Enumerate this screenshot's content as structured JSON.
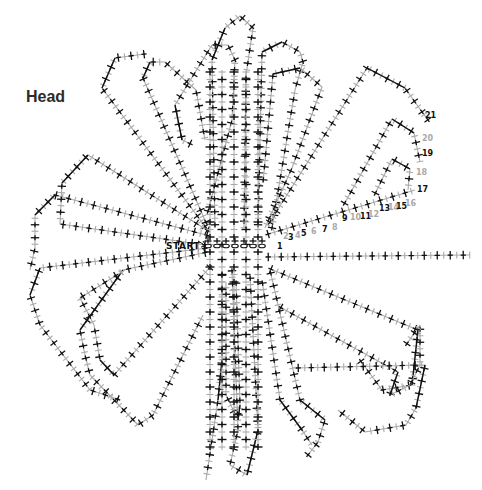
{
  "title": "Head",
  "start_label": "START",
  "colors": {
    "black": "#111111",
    "grey": "#a9a9a9",
    "background": "#ffffff"
  },
  "round_numbers": [
    {
      "n": "1",
      "x": 277,
      "y": 249,
      "color": "black"
    },
    {
      "n": "2",
      "x": 283,
      "y": 239,
      "color": "grey"
    },
    {
      "n": "3",
      "x": 288,
      "y": 240,
      "color": "black"
    },
    {
      "n": "4",
      "x": 295,
      "y": 238,
      "color": "grey"
    },
    {
      "n": "5",
      "x": 301,
      "y": 236,
      "color": "black"
    },
    {
      "n": "6",
      "x": 311,
      "y": 234,
      "color": "grey"
    },
    {
      "n": "7",
      "x": 322,
      "y": 232,
      "color": "black"
    },
    {
      "n": "8",
      "x": 332,
      "y": 230,
      "color": "grey"
    },
    {
      "n": "9",
      "x": 342,
      "y": 221,
      "color": "black"
    },
    {
      "n": "10",
      "x": 350,
      "y": 220,
      "color": "grey"
    },
    {
      "n": "11",
      "x": 360,
      "y": 219,
      "color": "black"
    },
    {
      "n": "12",
      "x": 368,
      "y": 217,
      "color": "grey"
    },
    {
      "n": "13",
      "x": 379,
      "y": 211,
      "color": "black"
    },
    {
      "n": "14",
      "x": 388,
      "y": 210,
      "color": "grey"
    },
    {
      "n": "15",
      "x": 396,
      "y": 209,
      "color": "black"
    },
    {
      "n": "16",
      "x": 405,
      "y": 206,
      "color": "grey"
    },
    {
      "n": "17",
      "x": 417,
      "y": 192,
      "color": "black"
    },
    {
      "n": "18",
      "x": 416,
      "y": 175,
      "color": "grey"
    },
    {
      "n": "19",
      "x": 422,
      "y": 156,
      "color": "black"
    },
    {
      "n": "20",
      "x": 422,
      "y": 141,
      "color": "grey"
    },
    {
      "n": "21",
      "x": 425,
      "y": 118,
      "color": "black"
    }
  ],
  "petals": [
    {
      "name": "top-left-outer",
      "points": [
        [
          207,
          229
        ],
        [
          102,
          88
        ],
        [
          115,
          58
        ],
        [
          145,
          54
        ]
      ],
      "open": true
    },
    {
      "name": "top-left-2",
      "points": [
        [
          207,
          225
        ],
        [
          143,
          78
        ],
        [
          150,
          62
        ],
        [
          165,
          62
        ],
        [
          196,
          90
        ],
        [
          205,
          140
        ]
      ]
    },
    {
      "name": "top-left-3",
      "points": [
        [
          193,
          145
        ],
        [
          182,
          140
        ],
        [
          175,
          105
        ],
        [
          212,
          45
        ],
        [
          228,
          45
        ],
        [
          235,
          60
        ],
        [
          232,
          120
        ],
        [
          207,
          215
        ]
      ]
    },
    {
      "name": "top-mid-1",
      "points": [
        [
          215,
          228
        ],
        [
          212,
          60
        ],
        [
          225,
          28
        ],
        [
          240,
          16
        ],
        [
          253,
          28
        ],
        [
          246,
          75
        ],
        [
          244,
          228
        ]
      ]
    },
    {
      "name": "top-mid-2",
      "points": [
        [
          258,
          228
        ],
        [
          262,
          52
        ],
        [
          282,
          42
        ],
        [
          300,
          52
        ],
        [
          303,
          62
        ],
        [
          295,
          90
        ],
        [
          272,
          228
        ]
      ]
    },
    {
      "name": "top-right-1",
      "points": [
        [
          263,
          183
        ],
        [
          273,
          74
        ],
        [
          300,
          68
        ],
        [
          322,
          87
        ],
        [
          292,
          168
        ],
        [
          265,
          228
        ]
      ]
    },
    {
      "name": "top-right-2",
      "points": [
        [
          268,
          225
        ],
        [
          367,
          68
        ],
        [
          405,
          88
        ],
        [
          422,
          112
        ],
        [
          428,
          120
        ]
      ],
      "open": true
    },
    {
      "name": "right-small-1",
      "points": [
        [
          343,
          206
        ],
        [
          392,
          119
        ],
        [
          414,
          133
        ],
        [
          420,
          162
        ]
      ],
      "open": true
    },
    {
      "name": "right-small-2",
      "points": [
        [
          374,
          196
        ],
        [
          392,
          159
        ],
        [
          410,
          169
        ],
        [
          408,
          190
        ]
      ],
      "open": true
    },
    {
      "name": "round-1-row",
      "points": [
        [
          265,
          235
        ],
        [
          415,
          190
        ]
      ],
      "open": true
    },
    {
      "name": "left-outer",
      "points": [
        [
          210,
          236
        ],
        [
          55,
          195
        ],
        [
          35,
          215
        ],
        [
          35,
          248
        ],
        [
          30,
          270
        ]
      ],
      "open": true
    },
    {
      "name": "left-2",
      "points": [
        [
          210,
          232
        ],
        [
          88,
          155
        ],
        [
          62,
          183
        ],
        [
          60,
          224
        ],
        [
          205,
          245
        ]
      ]
    },
    {
      "name": "left-bottom-1",
      "points": [
        [
          208,
          248
        ],
        [
          40,
          268
        ],
        [
          30,
          295
        ],
        [
          40,
          325
        ],
        [
          90,
          390
        ],
        [
          120,
          400
        ]
      ],
      "open": true
    },
    {
      "name": "left-bottom-2",
      "points": [
        [
          208,
          252
        ],
        [
          123,
          270
        ],
        [
          80,
          330
        ],
        [
          85,
          355
        ],
        [
          90,
          375
        ],
        [
          138,
          425
        ],
        [
          153,
          415
        ],
        [
          203,
          315
        ]
      ]
    },
    {
      "name": "left-bottom-3",
      "points": [
        [
          212,
          265
        ],
        [
          114,
          375
        ],
        [
          100,
          360
        ],
        [
          94,
          325
        ],
        [
          80,
          298
        ],
        [
          125,
          270
        ]
      ],
      "open": true
    },
    {
      "name": "right-long",
      "points": [
        [
          265,
          257
        ],
        [
          470,
          255
        ]
      ],
      "open": true
    },
    {
      "name": "right-bottom-1",
      "points": [
        [
          268,
          268
        ],
        [
          418,
          330
        ],
        [
          412,
          385
        ],
        [
          382,
          390
        ],
        [
          360,
          360
        ]
      ],
      "open": true
    },
    {
      "name": "right-bottom-2",
      "points": [
        [
          278,
          306
        ],
        [
          398,
          372
        ],
        [
          390,
          395
        ],
        [
          410,
          385
        ],
        [
          420,
          365
        ],
        [
          420,
          325
        ],
        [
          406,
          345
        ]
      ],
      "open": true
    },
    {
      "name": "right-bottom-3",
      "points": [
        [
          295,
          368
        ],
        [
          425,
          365
        ],
        [
          416,
          408
        ],
        [
          406,
          425
        ],
        [
          365,
          432
        ],
        [
          338,
          410
        ]
      ],
      "open": true
    },
    {
      "name": "bottom-1",
      "points": [
        [
          270,
          270
        ],
        [
          300,
          400
        ],
        [
          325,
          420
        ],
        [
          318,
          442
        ],
        [
          308,
          455
        ]
      ],
      "open": true
    },
    {
      "name": "bottom-2",
      "points": [
        [
          262,
          280
        ],
        [
          280,
          400
        ],
        [
          302,
          430
        ],
        [
          312,
          445
        ]
      ],
      "open": true
    },
    {
      "name": "bottom-3",
      "points": [
        [
          250,
          275
        ],
        [
          258,
          430
        ],
        [
          247,
          475
        ],
        [
          230,
          465
        ],
        [
          238,
          430
        ],
        [
          232,
          270
        ]
      ]
    },
    {
      "name": "bottom-4",
      "points": [
        [
          222,
          272
        ],
        [
          222,
          360
        ],
        [
          218,
          400
        ],
        [
          206,
          480
        ]
      ],
      "open": true
    },
    {
      "name": "bottom-5",
      "points": [
        [
          236,
          280
        ],
        [
          240,
          405
        ],
        [
          238,
          420
        ],
        [
          226,
          395
        ],
        [
          226,
          282
        ]
      ]
    }
  ],
  "center_grid": {
    "x_from": 205,
    "x_to": 268,
    "y_from": 40,
    "y_to": 470,
    "columns": [
      210,
      222,
      234,
      246,
      258
    ],
    "chain_row": {
      "y": 246,
      "x_from": 208,
      "x_to": 262,
      "count": 7
    }
  }
}
